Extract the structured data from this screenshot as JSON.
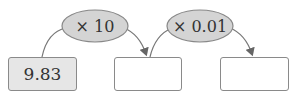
{
  "diagram": {
    "start_box": {
      "value": "9.83",
      "fill": "#e6e6e6"
    },
    "operations": [
      {
        "label": "× 10",
        "fill": "#d4d4d4"
      },
      {
        "label": "× 0.01",
        "fill": "#d4d4d4"
      }
    ],
    "answer_boxes": [
      {
        "value": ""
      },
      {
        "value": ""
      }
    ],
    "colors": {
      "stroke": "#777777",
      "arrow": "#666666"
    }
  }
}
